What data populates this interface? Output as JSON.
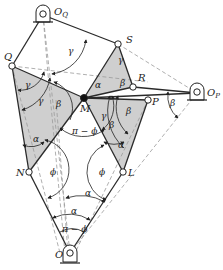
{
  "colors": {
    "line": "#2a2a2a",
    "dashed": "#9a9a9a",
    "shade": "#cfcfcf",
    "joint_fill": "#ffffff",
    "center_joint": "#111111"
  },
  "points": {
    "OQ": {
      "label": "O",
      "sub": "Q",
      "x": 43,
      "y": 15
    },
    "Q": {
      "label": "Q",
      "x": 12,
      "y": 66
    },
    "S": {
      "label": "S",
      "x": 118,
      "y": 44
    },
    "M": {
      "label": "M",
      "x": 84,
      "y": 98
    },
    "R": {
      "label": "R",
      "x": 133,
      "y": 87
    },
    "P": {
      "label": "P",
      "x": 148,
      "y": 100
    },
    "OP": {
      "label": "O",
      "sub": "P",
      "x": 197,
      "y": 93
    },
    "N": {
      "label": "N",
      "x": 29,
      "y": 172
    },
    "L": {
      "label": "L",
      "x": 123,
      "y": 172
    },
    "O": {
      "label": "O",
      "x": 70,
      "y": 253
    }
  },
  "angle_labels": {
    "gamma_top": "γ",
    "gamma_S": "γ",
    "gamma_Q1": "γ",
    "gamma_Q2": "γ",
    "gamma_M": "γ",
    "beta_left": "β",
    "beta_R": "β",
    "beta_right1": "β",
    "beta_right2": "β",
    "beta_OP": "β",
    "alpha_M": "α",
    "alpha_N": "α",
    "alpha_L": "α",
    "alpha_O1": "α",
    "alpha_O2": "α",
    "pi_minus_phi_M": "π − ϕ",
    "pi_minus_phi_O": "π − ϕ",
    "phi_N": "ϕ",
    "phi_L": "ϕ"
  }
}
